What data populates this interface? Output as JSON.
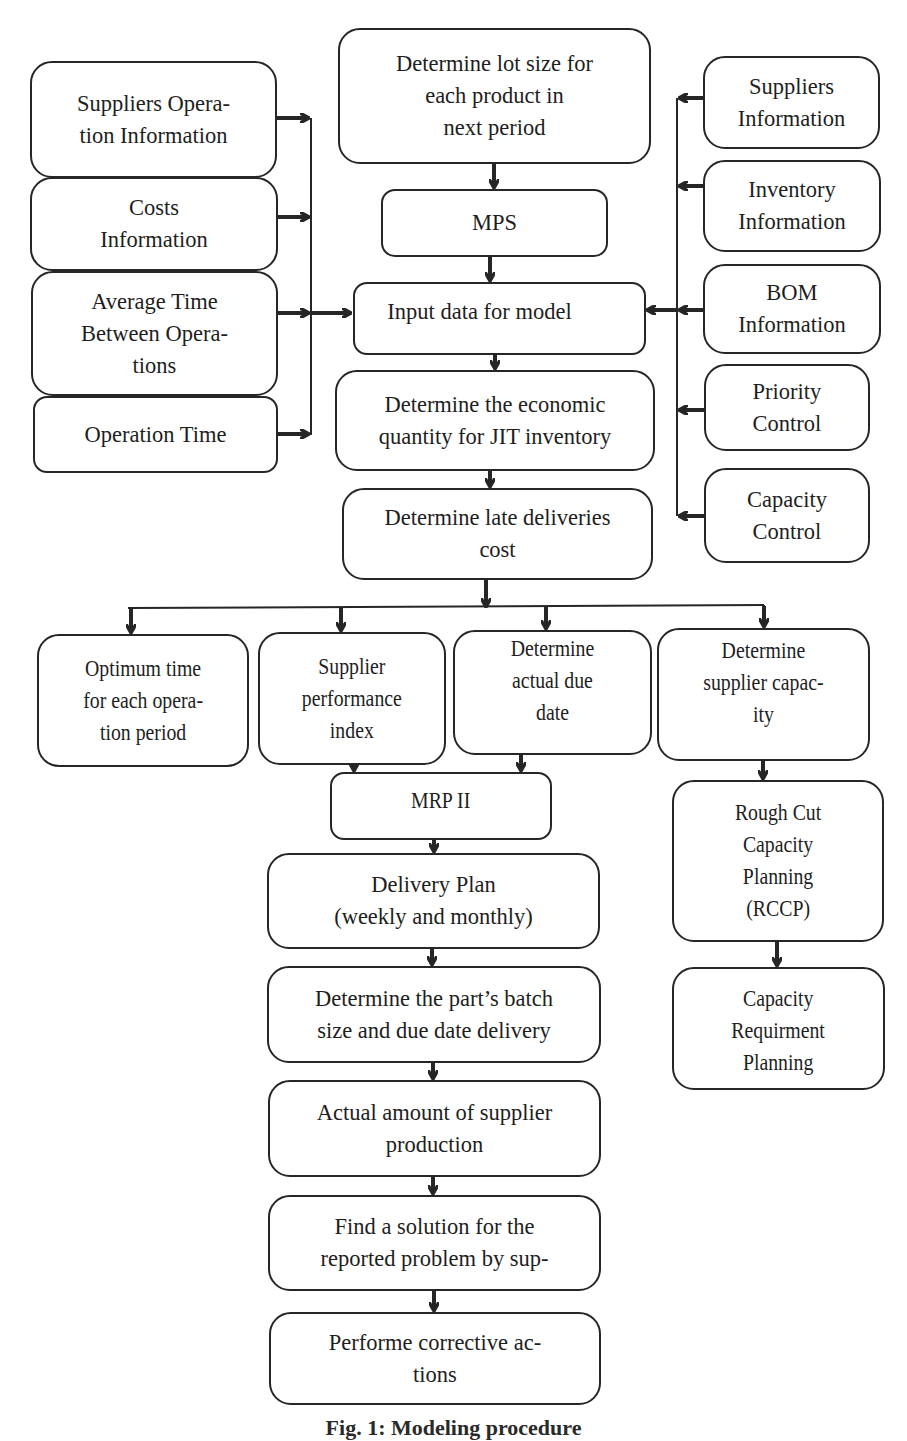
{
  "diagram": {
    "caption": "Fig. 1: Modeling procedure",
    "left_inputs": [
      {
        "id": "suppliers-operation-info",
        "label": "Suppliers Opera-\ntion Information"
      },
      {
        "id": "costs-info",
        "label": "Costs\nInformation"
      },
      {
        "id": "avg-time-between-ops",
        "label": "Average Time\nBetween Opera-\ntions"
      },
      {
        "id": "operation-time",
        "label": "Operation Time"
      }
    ],
    "right_inputs": [
      {
        "id": "suppliers-info",
        "label": "Suppliers\nInformation"
      },
      {
        "id": "inventory-info",
        "label": "Inventory\nInformation"
      },
      {
        "id": "bom-info",
        "label": "BOM\nInformation"
      },
      {
        "id": "priority-control",
        "label": "Priority\nControl"
      },
      {
        "id": "capacity-control",
        "label": "Capacity\nControl"
      }
    ],
    "main_flow": [
      {
        "id": "lot-size",
        "label": "Determine lot size for\neach product in\nnext period"
      },
      {
        "id": "mps",
        "label": "MPS"
      },
      {
        "id": "input-data",
        "label": "Input data for model"
      },
      {
        "id": "economic-quantity",
        "label": "Determine the economic\nquantity for JIT inventory"
      },
      {
        "id": "late-deliveries",
        "label": "Determine late deliveries\ncost"
      }
    ],
    "branches": [
      {
        "id": "optimum-time",
        "label": "Optimum time\nfor each opera-\ntion period"
      },
      {
        "id": "supplier-performance",
        "label": "Supplier\nperformance\nindex"
      },
      {
        "id": "actual-due-date",
        "label": "Determine\nactual due\ndate"
      },
      {
        "id": "supplier-capacity",
        "label": "Determine\nsupplier capac-\nity"
      }
    ],
    "mrp_flow": [
      {
        "id": "mrp2",
        "label": "MRP II"
      },
      {
        "id": "delivery-plan",
        "label": "Delivery Plan\n(weekly and monthly)"
      },
      {
        "id": "batch-size",
        "label": "Determine the part’s batch\nsize and due date delivery"
      },
      {
        "id": "actual-production",
        "label": "Actual amount of supplier\nproduction"
      },
      {
        "id": "find-solution",
        "label": "Find a solution for the\nreported problem by sup-"
      },
      {
        "id": "corrective-actions",
        "label": "Performe corrective ac-\ntions"
      }
    ],
    "capacity_flow": [
      {
        "id": "rccp",
        "label": "Rough Cut\nCapacity\nPlanning\n(RCCP)"
      },
      {
        "id": "crp",
        "label": "Capacity\nRequirment\nPlanning"
      }
    ],
    "colors": {
      "stroke": "#262626",
      "background": "#ffffff",
      "text": "#1e1e1e"
    }
  }
}
